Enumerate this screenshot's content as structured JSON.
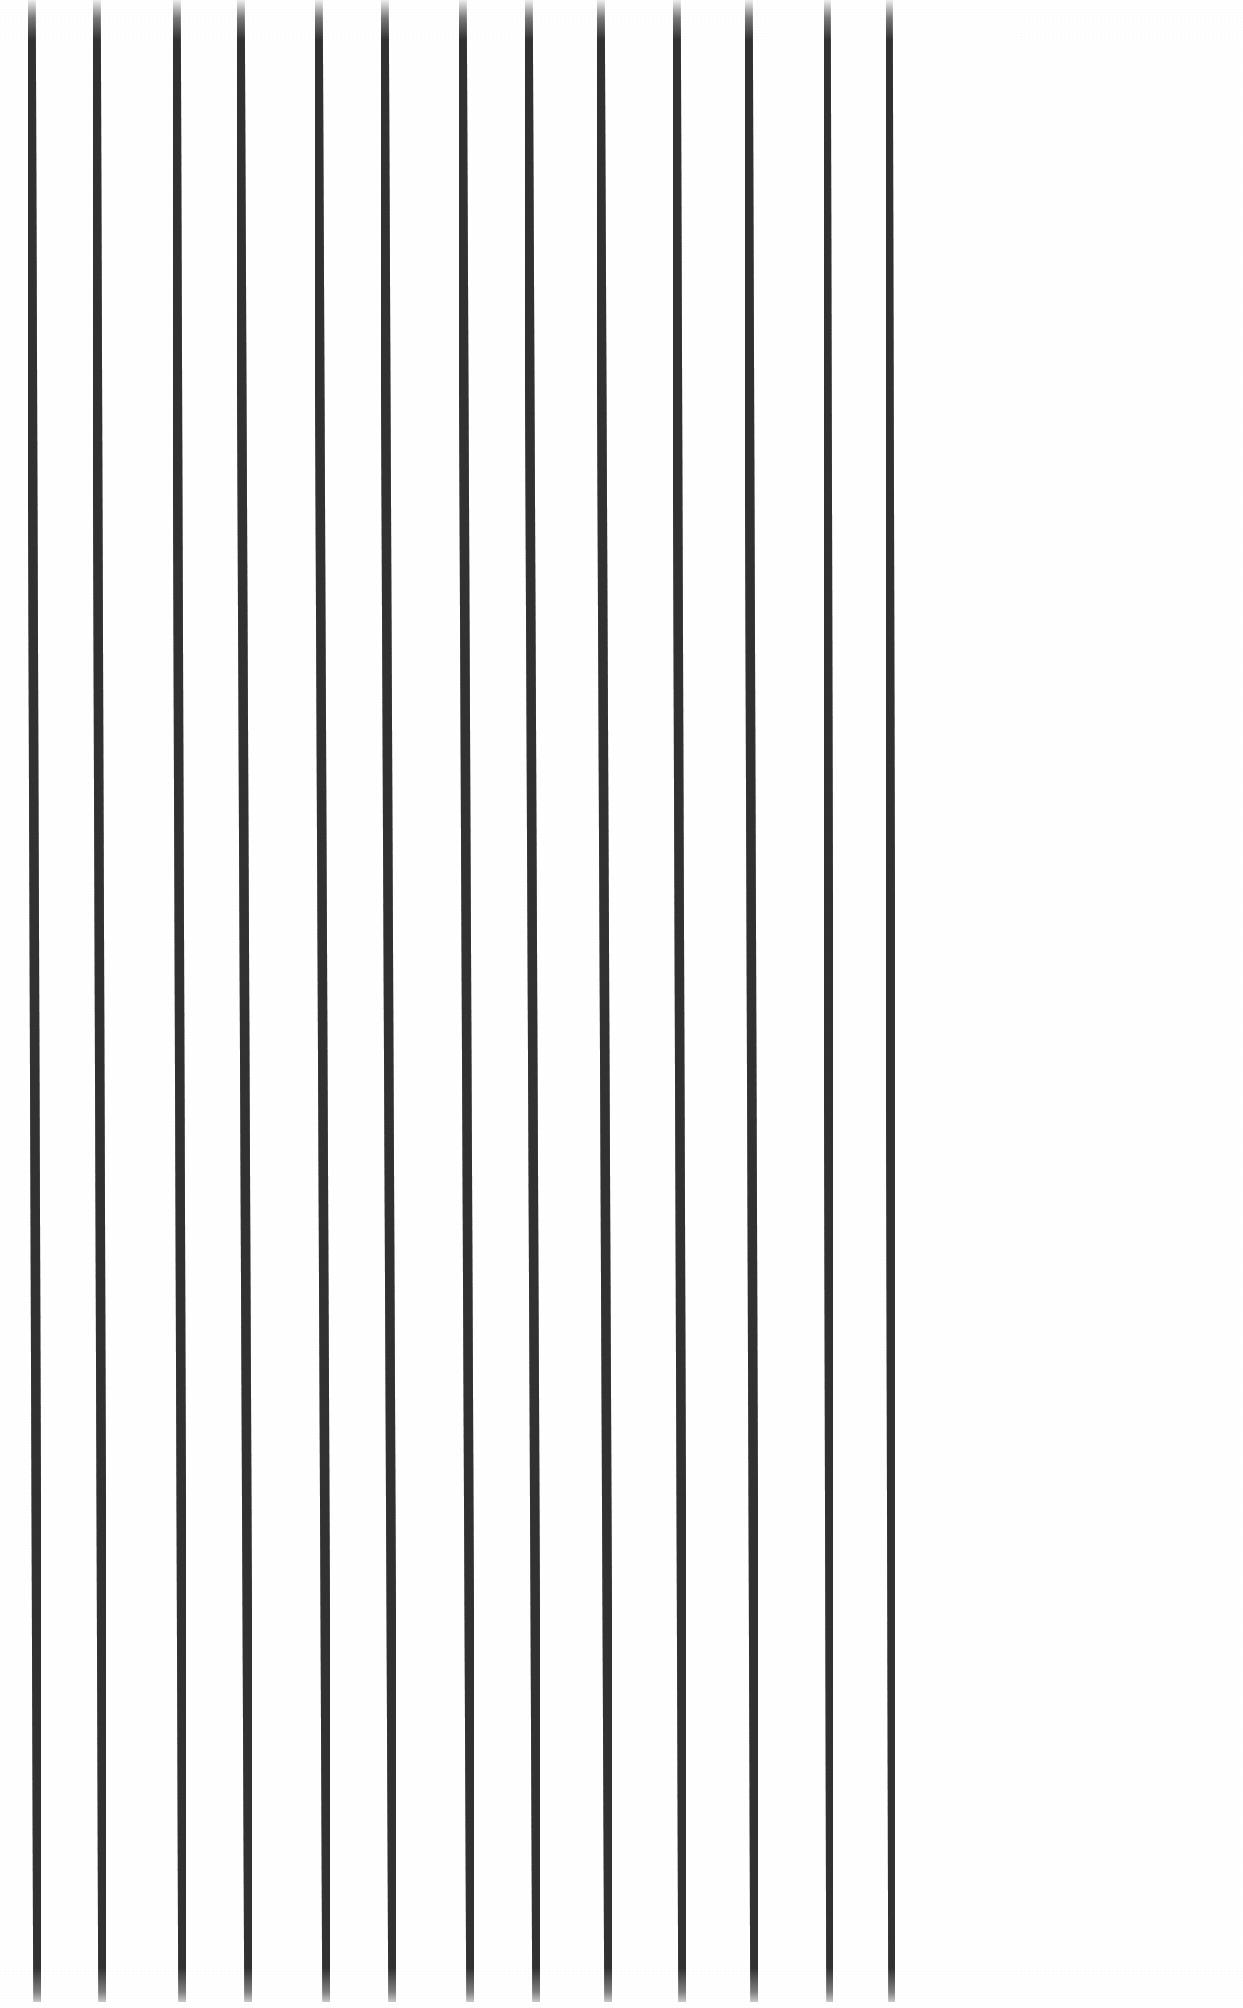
{
  "image": {
    "kind": "scanned-line-drawing",
    "width": 1243,
    "height": 2008,
    "background_color": "#ffffff",
    "stroke_color": "#323232",
    "stroke_color_light": "#4a4a4a",
    "description": "Thirteen near-vertical dark ink lines on a plain white page, evenly spaced across the full width and running the full height of the page, each slanting very slightly to the right from top to bottom with softly faded ends."
  },
  "chart_data": {
    "type": "line",
    "title": "",
    "subtitle": "",
    "xlabel": "",
    "ylabel": "",
    "grid": false,
    "legend_position": "none",
    "tick_labels_x": [],
    "tick_labels_y": [],
    "annotations": [],
    "xlim": [
      0,
      1243
    ],
    "ylim": [
      0,
      2008
    ],
    "stroke_width": 9.5,
    "stroke_color": "#323232",
    "background_color": "#ffffff",
    "count": 13,
    "spacing_px": 92.8,
    "series": [
      {
        "name": "line-1",
        "x_top": 31,
        "x_bottom": 38,
        "y_top": 0,
        "y_bottom": 2002,
        "width": 9.5
      },
      {
        "name": "line-2",
        "x_top": 96,
        "x_bottom": 103,
        "y_top": 0,
        "y_bottom": 2002,
        "width": 9.5
      },
      {
        "name": "line-3",
        "x_top": 176,
        "x_bottom": 183,
        "y_top": 0,
        "y_bottom": 2002,
        "width": 9.5
      },
      {
        "name": "line-4",
        "x_top": 240,
        "x_bottom": 249,
        "y_top": 0,
        "y_bottom": 2002,
        "width": 9.5
      },
      {
        "name": "line-5",
        "x_top": 318,
        "x_bottom": 327,
        "y_top": 0,
        "y_bottom": 2002,
        "width": 9.5
      },
      {
        "name": "line-6",
        "x_top": 384,
        "x_bottom": 393,
        "y_top": 0,
        "y_bottom": 2002,
        "width": 9.5
      },
      {
        "name": "line-7",
        "x_top": 462,
        "x_bottom": 471,
        "y_top": 0,
        "y_bottom": 2002,
        "width": 9.5
      },
      {
        "name": "line-8",
        "x_top": 528,
        "x_bottom": 537,
        "y_top": 0,
        "y_bottom": 2002,
        "width": 9.5
      },
      {
        "name": "line-9",
        "x_top": 600,
        "x_bottom": 609,
        "y_top": 0,
        "y_bottom": 2002,
        "width": 9.5
      },
      {
        "name": "line-10",
        "x_top": 676,
        "x_bottom": 683,
        "y_top": 0,
        "y_bottom": 2002,
        "width": 9.5
      },
      {
        "name": "line-11",
        "x_top": 748,
        "x_bottom": 755,
        "y_top": 0,
        "y_bottom": 2002,
        "width": 9.5
      },
      {
        "name": "line-12",
        "x_top": 826,
        "x_bottom": 831,
        "y_top": 0,
        "y_bottom": 2002,
        "width": 9.5
      },
      {
        "name": "line-13",
        "x_top": 888,
        "x_bottom": 893,
        "y_top": 0,
        "y_bottom": 2002,
        "width": 9.5
      }
    ]
  }
}
